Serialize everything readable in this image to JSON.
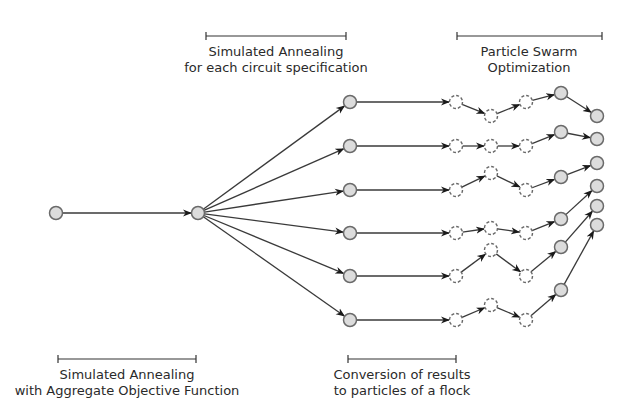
{
  "labels": {
    "sa_each": {
      "line1": "Simulated Annealing",
      "line2": "for each circuit specification",
      "bracket": [
        206,
        346,
        36
      ],
      "cx": 276,
      "y1": 56,
      "y2": 72
    },
    "pso": {
      "line1": "Particle Swarm",
      "line2": "Optimization",
      "bracket": [
        457,
        602,
        36
      ],
      "cx": 529,
      "y1": 56,
      "y2": 72
    },
    "sa_aggregate": {
      "line1": "Simulated Annealing",
      "line2": "with Aggregate Objective Function",
      "bracket": [
        58,
        196,
        359
      ],
      "cx": 127,
      "y1": 379,
      "y2": 395
    },
    "conversion": {
      "line1": "Conversion of results",
      "line2": "to particles of a flock",
      "bracket": [
        348,
        456,
        359
      ],
      "cx": 402,
      "y1": 379,
      "y2": 395
    }
  },
  "colors": {
    "node_fill": "#dcdcdc",
    "node_stroke": "#6a6a6a",
    "edge": "#3a3a3a",
    "text": "#2a2a2a"
  },
  "nodes": {
    "start": {
      "x": 56,
      "y": 213
    },
    "hub": {
      "x": 198,
      "y": 213
    },
    "rows": [
      {
        "sa": [
          350,
          102
        ],
        "dashed": [
          [
            456,
            102
          ],
          [
            491,
            116
          ],
          [
            526,
            102
          ]
        ],
        "pso": [
          561,
          93
        ],
        "final": [
          597,
          116
        ]
      },
      {
        "sa": [
          350,
          146
        ],
        "dashed": [
          [
            456,
            146
          ],
          [
            491,
            146
          ],
          [
            526,
            146
          ]
        ],
        "pso": [
          561,
          132
        ],
        "final": [
          597,
          139
        ]
      },
      {
        "sa": [
          350,
          190
        ],
        "dashed": [
          [
            456,
            190
          ],
          [
            491,
            173
          ],
          [
            526,
            190
          ]
        ],
        "pso": [
          561,
          177
        ],
        "final": [
          597,
          163
        ]
      },
      {
        "sa": [
          350,
          233
        ],
        "dashed": [
          [
            456,
            233
          ],
          [
            491,
            228
          ],
          [
            526,
            233
          ]
        ],
        "pso": [
          561,
          219
        ],
        "final": [
          597,
          186
        ]
      },
      {
        "sa": [
          350,
          276
        ],
        "dashed": [
          [
            456,
            276
          ],
          [
            491,
            250
          ],
          [
            526,
            276
          ]
        ],
        "pso": [
          561,
          247
        ],
        "final": [
          597,
          206
        ]
      },
      {
        "sa": [
          350,
          320
        ],
        "dashed": [
          [
            456,
            320
          ],
          [
            491,
            305
          ],
          [
            526,
            320
          ]
        ],
        "pso": [
          561,
          290
        ],
        "final": [
          597,
          225
        ]
      }
    ]
  }
}
